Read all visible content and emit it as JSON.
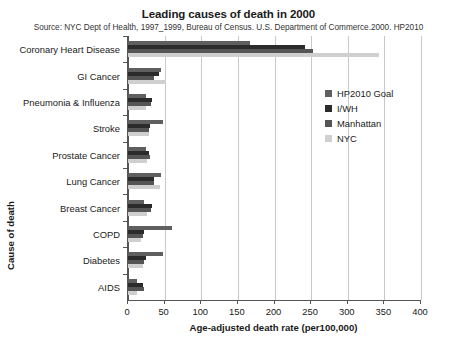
{
  "chart_data": {
    "type": "bar",
    "orientation": "horizontal",
    "title": "Leading causes of death in 2000",
    "subtitle": "Source: NYC Dept of Health, 1997_1999, Bureau of Census. U.S. Department of Commerce.2000. HP2010",
    "xlabel": "Age-adjusted death rate (per100,000)",
    "ylabel": "Cause of death",
    "xlim": [
      0,
      400
    ],
    "xticks": [
      0,
      50,
      100,
      150,
      200,
      250,
      300,
      350,
      400
    ],
    "grid": true,
    "legend_position": "upper right",
    "categories": [
      "Coronary Heart Disease",
      "GI Cancer",
      "Pneumonia & Influenza",
      "Stroke",
      "Prostate Cancer",
      "Lung Cancer",
      "Breast Cancer",
      "COPD",
      "Diabetes",
      "AIDS"
    ],
    "series": [
      {
        "name": "HP2010 Goal",
        "color": "#5f5f5f",
        "values": [
          166,
          45,
          25,
          48,
          25,
          45,
          22,
          60,
          48,
          12
        ]
      },
      {
        "name": "I/WH",
        "color": "#2b2b2b",
        "values": [
          241,
          43,
          33,
          30,
          28,
          35,
          33,
          22,
          25,
          20
        ]
      },
      {
        "name": "Manhattan",
        "color": "#555555",
        "values": [
          252,
          36,
          32,
          28,
          30,
          35,
          32,
          20,
          22,
          22
        ]
      },
      {
        "name": "NYC",
        "color": "#cfcfcf",
        "values": [
          343,
          52,
          25,
          28,
          26,
          44,
          26,
          18,
          20,
          12
        ]
      }
    ]
  },
  "legend": {
    "items": [
      {
        "label": "HP2010 Goal",
        "color": "#5f5f5f"
      },
      {
        "label": "I/WH",
        "color": "#2b2b2b"
      },
      {
        "label": "Manhattan",
        "color": "#555555"
      },
      {
        "label": "NYC",
        "color": "#cfcfcf"
      }
    ]
  }
}
